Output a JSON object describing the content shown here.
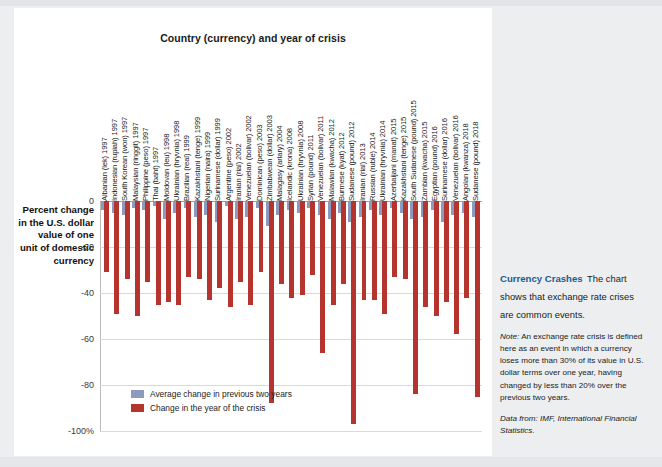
{
  "figure": {
    "title": "Country (currency) and year of crisis",
    "yaxis_caption": "Percent change in the U.S. dollar value of one unit of domestic currency"
  },
  "legend": {
    "items": [
      {
        "label": "Average change in previous two years",
        "color": "#8c9ac0"
      },
      {
        "label": "Change in the year of the crisis",
        "color": "#b5352e"
      }
    ]
  },
  "caption": {
    "heading": "Currency Crashes",
    "lead": "The chart shows that exchange rate crises are common events.",
    "note_label": "Note:",
    "note": "An exchange rate crisis is defined here as an event in which a currency loses more than 30% of its value in U.S. dollar terms over one year, having changed by less than 20% over the previous two years.",
    "source": "Data from: IMF, International Financial Statistics."
  },
  "chart_data": {
    "type": "bar",
    "title": "Country (currency) and year of crisis",
    "xlabel": "Country (currency) and year of crisis",
    "ylabel": "Percent change in the U.S. dollar value of one unit of domestic currency",
    "ylim": [
      -100,
      0
    ],
    "yticks": [
      0,
      -20,
      -40,
      -60,
      -80,
      -100
    ],
    "ytick_labels": [
      "0",
      "-20",
      "-40",
      "-60",
      "-80",
      "-100%"
    ],
    "grid": true,
    "legend_position": "inside-bottom-left",
    "categories": [
      "Albanian (lek) 1997",
      "Indonesian (rupiah) 1997",
      "South Korean (won) 1997",
      "Malaysian (ringgit) 1997",
      "Philippine (peso) 1997",
      "Thai (baht) 1997",
      "Moldovan (leu) 1998",
      "Ukrainian (hryvnia) 1998",
      "Brazilian (real) 1999",
      "Kazakhstani (tenge) 1999",
      "Nigerian (naira) 1999",
      "Surinamese (dollar) 1999",
      "Argentine (peso) 2002",
      "Iranian (rial) 2002",
      "Venezuelan (bolivar) 2002",
      "Dominican (peso) 2003",
      "Zimbabwean (dollar) 2003",
      "Malagasy (ariary) 2004",
      "Icelandic (krona) 2008",
      "Ukrainian (hryvnia) 2008",
      "Syrian (pound) 2011",
      "Venezuelan (bolivar) 2011",
      "Malawian (kwacha) 2012",
      "Burmese (kyat) 2012",
      "Sudanese (pound) 2012",
      "Iranian (rial) 2013",
      "Russian (ruble) 2014",
      "Ukrainian (hryvnia) 2014",
      "Azerbaijani (manat) 2015",
      "Kazakhstani (tenge) 2015",
      "South Sudanese (pound) 2015",
      "Zambian (kwacha) 2015",
      "Egyptian (pound) 2016",
      "Surinamese (dollar) 2016",
      "Venezuelan (bolivar) 2016",
      "Angolan (kwanza) 2018",
      "Sudanese (pound) 2018"
    ],
    "series": [
      {
        "name": "Average change in previous two years",
        "color": "#8c9ac0",
        "values": [
          -4,
          -5,
          -6,
          -3,
          -4,
          -2,
          -8,
          -5,
          -3,
          -7,
          -6,
          -9,
          -2,
          -8,
          -7,
          -3,
          -11,
          -6,
          -4,
          -5,
          -3,
          -6,
          -8,
          -5,
          -9,
          -7,
          -4,
          -6,
          -3,
          -5,
          -8,
          -7,
          -4,
          -9,
          -6,
          -5,
          -7
        ]
      },
      {
        "name": "Change in the year of the crisis",
        "color": "#b5352e",
        "values": [
          -31,
          -49,
          -34,
          -50,
          -35,
          -45,
          -44,
          -45,
          -33,
          -34,
          -43,
          -38,
          -46,
          -35,
          -45,
          -31,
          -88,
          -36,
          -42,
          -41,
          -32,
          -66,
          -45,
          -36,
          -97,
          -43,
          -43,
          -49,
          -33,
          -34,
          -84,
          -46,
          -50,
          -44,
          -58,
          -42,
          -85
        ]
      }
    ]
  }
}
